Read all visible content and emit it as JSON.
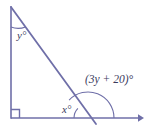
{
  "figure": {
    "kind": "geometry-diagram",
    "stroke_color": "#6f6fa8",
    "label_color": "#3a3a5c",
    "background_color": "#ffffff",
    "labels": {
      "vertex_top_angle": "y°",
      "interior_base_angle": "x°",
      "exterior_angle": "(3y + 20)°"
    },
    "marks": {
      "right_angle_corner": "right-angle-square",
      "arrow_end": "horizontal-ray-arrowhead"
    },
    "geometry": {
      "top_vertex": [
        11,
        7
      ],
      "bottom_left_vertex": [
        11,
        118
      ],
      "transversal_end": [
        96,
        124
      ],
      "ray_start": [
        11,
        118
      ],
      "ray_end": [
        142,
        118
      ],
      "intersection": [
        88,
        118
      ],
      "small_arc_radius": 14,
      "large_arc_radius": 26,
      "top_arc_radius": 20
    }
  }
}
